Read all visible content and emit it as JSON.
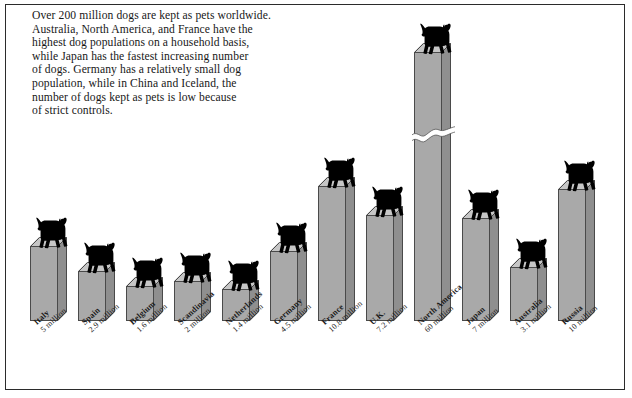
{
  "caption": "Over 200 million dogs are kept as pets worldwide.\nAustralia, North America, and France have the\nhighest dog populations on a household basis,\nwhile Japan has the fastest increasing number\nof dogs. Germany has a relatively small dog\npopulation, while in China and Iceland, the\nnumber of dogs kept as pets is low because\nof strict controls.",
  "colors": {
    "bar_front": "#a9a9a9",
    "bar_side": "#8f8f8f",
    "bar_top": "#c6c6c6",
    "outline": "#4a4a4a",
    "dog": "#000000",
    "frame": "#2b2b2b",
    "background": "#ffffff",
    "text": "#171717"
  },
  "chart_data": {
    "type": "bar",
    "title": "",
    "subtitle": "",
    "xlabel": "",
    "ylabel": "",
    "unit": "million dogs",
    "grid": false,
    "legend": "none",
    "axis_broken_series": [
      "North America"
    ],
    "categories": [
      "Italy",
      "Spain",
      "Belgium",
      "Scandinavia",
      "Netherlands",
      "Germany",
      "France",
      "U.K.",
      "North America",
      "Japan",
      "Australia",
      "Russia"
    ],
    "values": [
      5,
      2.9,
      1.6,
      2,
      1.4,
      4.5,
      10.8,
      7.2,
      60,
      7,
      3.1,
      10
    ],
    "value_labels": [
      "5 million",
      "2.9 million",
      "1.6 million",
      "2 million",
      "1.4 million",
      "4.5 million",
      "10.8 million",
      "7.2 million",
      "60 million",
      "7 million",
      "3.1 million",
      "10 million"
    ],
    "ylim": [
      0,
      60
    ],
    "bars": [
      {
        "name": "Italy",
        "value_label": "5 million",
        "x": 30,
        "top": 237,
        "broken": false
      },
      {
        "name": "Spain",
        "value_label": "2.9 million",
        "x": 78,
        "top": 262,
        "broken": false
      },
      {
        "name": "Belgium",
        "value_label": "1.6 million",
        "x": 126,
        "top": 277,
        "broken": false
      },
      {
        "name": "Scandinavia",
        "value_label": "2 million",
        "x": 174,
        "top": 272,
        "broken": false
      },
      {
        "name": "Netherlands",
        "value_label": "1.4 million",
        "x": 222,
        "top": 280,
        "broken": false
      },
      {
        "name": "Germany",
        "value_label": "4.5 million",
        "x": 270,
        "top": 242,
        "broken": false
      },
      {
        "name": "France",
        "value_label": "10.8 million",
        "x": 318,
        "top": 177,
        "broken": false
      },
      {
        "name": "U.K.",
        "value_label": "7.2 million",
        "x": 366,
        "top": 206,
        "broken": false
      },
      {
        "name": "North America",
        "value_label": "60 million",
        "x": 414,
        "top": 43,
        "broken": true
      },
      {
        "name": "Japan",
        "value_label": "7 million",
        "x": 462,
        "top": 209,
        "broken": false
      },
      {
        "name": "Australia",
        "value_label": "3.1 million",
        "x": 510,
        "top": 258,
        "broken": false
      },
      {
        "name": "Russia",
        "value_label": "10 million",
        "x": 558,
        "top": 180,
        "broken": false
      }
    ],
    "baseline_y": 312,
    "bar_width": 28,
    "bar_depth": 9
  }
}
